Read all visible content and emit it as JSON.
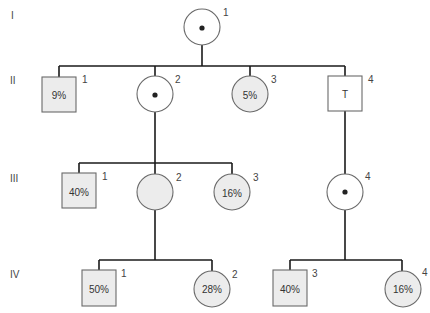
{
  "diagram": {
    "type": "pedigree-chart",
    "colors": {
      "line": "#1a1a1a",
      "shape_border": "#6a6a6a",
      "shaded_fill": "#ececec",
      "unshaded_fill": "#ffffff",
      "dot": "#222222"
    },
    "generations": [
      {
        "label": "I"
      },
      {
        "label": "II"
      },
      {
        "label": "III"
      },
      {
        "label": "IV"
      }
    ],
    "individuals": {
      "I1": {
        "gen": "I",
        "number": "1",
        "sex": "female",
        "carrier_dot": true,
        "shaded": false,
        "text": ""
      },
      "II1": {
        "gen": "II",
        "number": "1",
        "sex": "male",
        "carrier_dot": false,
        "shaded": true,
        "text": "9%"
      },
      "II2": {
        "gen": "II",
        "number": "2",
        "sex": "female",
        "carrier_dot": true,
        "shaded": false,
        "text": ""
      },
      "II3": {
        "gen": "II",
        "number": "3",
        "sex": "female",
        "carrier_dot": false,
        "shaded": true,
        "text": "5%"
      },
      "II4": {
        "gen": "II",
        "number": "4",
        "sex": "male",
        "carrier_dot": false,
        "shaded": false,
        "text": "T"
      },
      "III1": {
        "gen": "III",
        "number": "1",
        "sex": "male",
        "carrier_dot": false,
        "shaded": true,
        "text": "40%"
      },
      "III2": {
        "gen": "III",
        "number": "2",
        "sex": "female",
        "carrier_dot": false,
        "shaded": true,
        "text": ""
      },
      "III3": {
        "gen": "III",
        "number": "3",
        "sex": "female",
        "carrier_dot": false,
        "shaded": true,
        "text": "16%"
      },
      "III4": {
        "gen": "III",
        "number": "4",
        "sex": "female",
        "carrier_dot": true,
        "shaded": false,
        "text": ""
      },
      "IV1": {
        "gen": "IV",
        "number": "1",
        "sex": "male",
        "carrier_dot": false,
        "shaded": true,
        "text": "50%"
      },
      "IV2": {
        "gen": "IV",
        "number": "2",
        "sex": "female",
        "carrier_dot": false,
        "shaded": true,
        "text": "28%"
      },
      "IV3": {
        "gen": "IV",
        "number": "3",
        "sex": "male",
        "carrier_dot": false,
        "shaded": true,
        "text": "40%"
      },
      "IV4": {
        "gen": "IV",
        "number": "4",
        "sex": "female",
        "carrier_dot": false,
        "shaded": true,
        "text": "16%"
      }
    },
    "relationships": [
      {
        "parent": "I1",
        "children": [
          "II1",
          "II2",
          "II3",
          "II4"
        ]
      },
      {
        "parent": "II2",
        "children": [
          "III1",
          "III2",
          "III3"
        ]
      },
      {
        "parent": "II4",
        "children": [
          "III4"
        ]
      },
      {
        "parent": "III2",
        "children": [
          "IV1",
          "IV2"
        ]
      },
      {
        "parent": "III4",
        "children": [
          "IV3",
          "IV4"
        ]
      }
    ]
  }
}
